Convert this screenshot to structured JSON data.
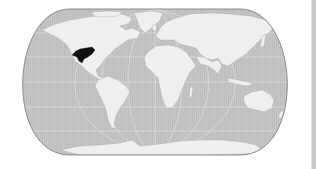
{
  "map": {
    "projection": "world-rounded (Eckert/Robinson style)",
    "colors": {
      "ocean": "#c4c4c4",
      "land": "#efefef",
      "graticule": "#e4e4e4",
      "outline": "#8a8a8a",
      "highlight": "#111111",
      "side_bar": "#c9c9c9"
    },
    "highlighted_region": {
      "label": "Southwestern United States / Northern Mexico",
      "color": "#111111"
    },
    "layers": [
      "ocean",
      "graticule",
      "continents",
      "highlighted-region",
      "outline"
    ]
  }
}
